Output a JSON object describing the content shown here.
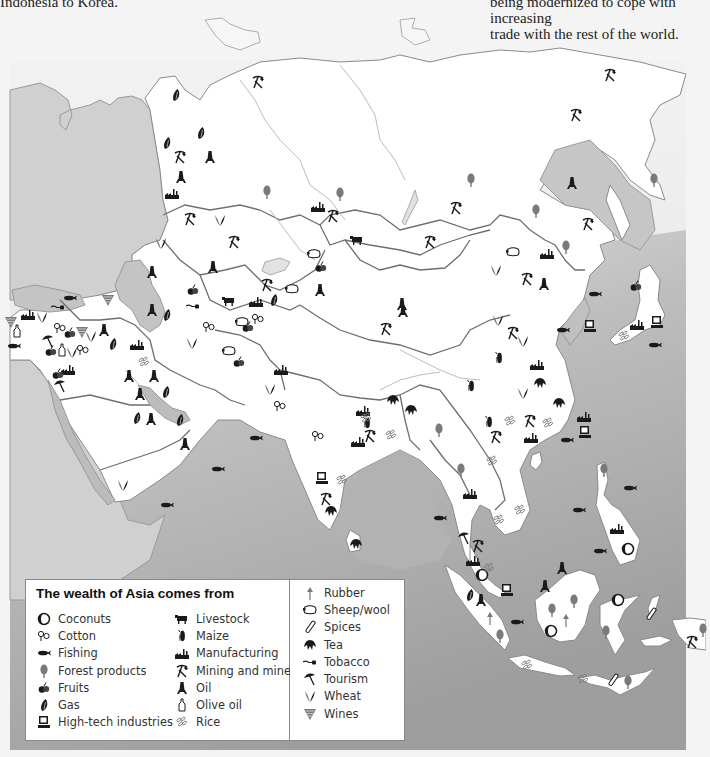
{
  "captions": {
    "left": "Indonesia to Korea.",
    "right_line1": "being modernized to cope with increasing",
    "right_line2": "trade with the rest of the world."
  },
  "colors": {
    "page_bg": "#f4f4f4",
    "sea": "#a9a9a9",
    "sea_light": "#c8c8c8",
    "land": "#ffffff",
    "other_land": "#cfcfcf",
    "border": "#6e6e6e",
    "river": "#b8b8b8",
    "icon_dark": "#1a1a1a",
    "icon_grey": "#7a7a7a"
  },
  "legend": {
    "title": "The wealth of Asia comes from",
    "columns": [
      [
        {
          "icon": "coconut-icon",
          "label": "Coconuts"
        },
        {
          "icon": "cotton-icon",
          "label": "Cotton"
        },
        {
          "icon": "fish-icon",
          "label": "Fishing"
        },
        {
          "icon": "tree-icon",
          "label": "Forest products"
        },
        {
          "icon": "fruit-icon",
          "label": "Fruits"
        },
        {
          "icon": "gas-flame-icon",
          "label": "Gas"
        },
        {
          "icon": "computer-icon",
          "label": "High-tech industries"
        }
      ],
      [
        {
          "icon": "cow-icon",
          "label": "Livestock"
        },
        {
          "icon": "maize-icon",
          "label": "Maize"
        },
        {
          "icon": "factory-icon",
          "label": "Manufacturing"
        },
        {
          "icon": "pickaxe-hammer-icon",
          "label": "Mining and minerals"
        },
        {
          "icon": "oil-derrick-icon",
          "label": "Oil"
        },
        {
          "icon": "olive-oil-bottle-icon",
          "label": "Olive oil"
        },
        {
          "icon": "rice-icon",
          "label": "Rice"
        }
      ],
      [
        {
          "icon": "rubber-tree-icon",
          "label": "Rubber"
        },
        {
          "icon": "sheep-icon",
          "label": "Sheep/wool"
        },
        {
          "icon": "spice-icon",
          "label": "Spices"
        },
        {
          "icon": "tea-leaf-icon",
          "label": "Tea"
        },
        {
          "icon": "tobacco-pipe-icon",
          "label": "Tobacco"
        },
        {
          "icon": "umbrella-icon",
          "label": "Tourism"
        },
        {
          "icon": "wheat-icon",
          "label": "Wheat"
        },
        {
          "icon": "grapes-icon",
          "label": "Wines"
        }
      ]
    ]
  },
  "map_icons": [
    {
      "type": "mine",
      "x": 258,
      "y": 82
    },
    {
      "type": "mine",
      "x": 610,
      "y": 75
    },
    {
      "type": "mine",
      "x": 576,
      "y": 115
    },
    {
      "type": "gas",
      "x": 176,
      "y": 95
    },
    {
      "type": "gas",
      "x": 201,
      "y": 133
    },
    {
      "type": "gas",
      "x": 167,
      "y": 143
    },
    {
      "type": "mine",
      "x": 180,
      "y": 157
    },
    {
      "type": "oil",
      "x": 210,
      "y": 157
    },
    {
      "type": "oil",
      "x": 181,
      "y": 177
    },
    {
      "type": "factory",
      "x": 172,
      "y": 193
    },
    {
      "type": "tree",
      "x": 267,
      "y": 192
    },
    {
      "type": "tree",
      "x": 340,
      "y": 194
    },
    {
      "type": "factory",
      "x": 318,
      "y": 206
    },
    {
      "type": "mine",
      "x": 333,
      "y": 216
    },
    {
      "type": "tree",
      "x": 471,
      "y": 180
    },
    {
      "type": "oil",
      "x": 572,
      "y": 183
    },
    {
      "type": "tree",
      "x": 654,
      "y": 180
    },
    {
      "type": "mine",
      "x": 456,
      "y": 208
    },
    {
      "type": "tree",
      "x": 536,
      "y": 211
    },
    {
      "type": "mine",
      "x": 588,
      "y": 224
    },
    {
      "type": "mine",
      "x": 190,
      "y": 219
    },
    {
      "type": "wheat",
      "x": 220,
      "y": 220
    },
    {
      "type": "mine",
      "x": 234,
      "y": 242
    },
    {
      "type": "wheat",
      "x": 161,
      "y": 243
    },
    {
      "type": "mine",
      "x": 430,
      "y": 242
    },
    {
      "type": "sheep",
      "x": 513,
      "y": 252
    },
    {
      "type": "factory",
      "x": 547,
      "y": 253
    },
    {
      "type": "tree",
      "x": 566,
      "y": 247
    },
    {
      "type": "cow",
      "x": 357,
      "y": 240
    },
    {
      "type": "sheep",
      "x": 314,
      "y": 254
    },
    {
      "type": "fruit",
      "x": 321,
      "y": 267
    },
    {
      "type": "wheat",
      "x": 496,
      "y": 270
    },
    {
      "type": "mine",
      "x": 527,
      "y": 279
    },
    {
      "type": "oil",
      "x": 544,
      "y": 284
    },
    {
      "type": "oil",
      "x": 152,
      "y": 272
    },
    {
      "type": "oil",
      "x": 213,
      "y": 267
    },
    {
      "type": "oil",
      "x": 320,
      "y": 290
    },
    {
      "type": "oil",
      "x": 402,
      "y": 304
    },
    {
      "type": "fruit",
      "x": 193,
      "y": 290
    },
    {
      "type": "tobacco",
      "x": 193,
      "y": 306
    },
    {
      "type": "cow",
      "x": 229,
      "y": 301
    },
    {
      "type": "factory",
      "x": 256,
      "y": 301
    },
    {
      "type": "gas",
      "x": 274,
      "y": 300
    },
    {
      "type": "mine",
      "x": 267,
      "y": 285
    },
    {
      "type": "sheep",
      "x": 292,
      "y": 289
    },
    {
      "type": "fish",
      "x": 595,
      "y": 294
    },
    {
      "type": "fruit",
      "x": 636,
      "y": 286
    },
    {
      "type": "fish",
      "x": 70,
      "y": 298
    },
    {
      "type": "grapes",
      "x": 108,
      "y": 300
    },
    {
      "type": "tobacco",
      "x": 58,
      "y": 307
    },
    {
      "type": "grapes",
      "x": 11,
      "y": 322
    },
    {
      "type": "factory",
      "x": 28,
      "y": 314
    },
    {
      "type": "wheat",
      "x": 42,
      "y": 317
    },
    {
      "type": "oil",
      "x": 152,
      "y": 310
    },
    {
      "type": "gas",
      "x": 167,
      "y": 315
    },
    {
      "type": "olive",
      "x": 17,
      "y": 331
    },
    {
      "type": "cotton",
      "x": 60,
      "y": 328
    },
    {
      "type": "fruit",
      "x": 70,
      "y": 333
    },
    {
      "type": "grapes",
      "x": 82,
      "y": 332
    },
    {
      "type": "oil",
      "x": 104,
      "y": 330
    },
    {
      "type": "cotton",
      "x": 209,
      "y": 327
    },
    {
      "type": "wheat",
      "x": 192,
      "y": 343
    },
    {
      "type": "sheep",
      "x": 242,
      "y": 322
    },
    {
      "type": "fruit",
      "x": 248,
      "y": 327
    },
    {
      "type": "cotton",
      "x": 258,
      "y": 319
    },
    {
      "type": "fish",
      "x": 14,
      "y": 346
    },
    {
      "type": "umbrella",
      "x": 48,
      "y": 341
    },
    {
      "type": "fruit",
      "x": 51,
      "y": 351
    },
    {
      "type": "olive",
      "x": 62,
      "y": 350
    },
    {
      "type": "wheat",
      "x": 72,
      "y": 352
    },
    {
      "type": "cotton",
      "x": 83,
      "y": 350
    },
    {
      "type": "wheat",
      "x": 91,
      "y": 336
    },
    {
      "type": "gas",
      "x": 113,
      "y": 344
    },
    {
      "type": "factory",
      "x": 137,
      "y": 344
    },
    {
      "type": "sheep",
      "x": 229,
      "y": 351
    },
    {
      "type": "fruit",
      "x": 239,
      "y": 362
    },
    {
      "type": "mine",
      "x": 386,
      "y": 329
    },
    {
      "type": "oil",
      "x": 403,
      "y": 311
    },
    {
      "type": "factory",
      "x": 68,
      "y": 369
    },
    {
      "type": "fruit",
      "x": 58,
      "y": 374
    },
    {
      "type": "rice",
      "x": 144,
      "y": 362
    },
    {
      "type": "oil",
      "x": 129,
      "y": 376
    },
    {
      "type": "oil",
      "x": 154,
      "y": 376
    },
    {
      "type": "factory",
      "x": 281,
      "y": 369
    },
    {
      "type": "wheat",
      "x": 270,
      "y": 389
    },
    {
      "type": "umbrella",
      "x": 60,
      "y": 386
    },
    {
      "type": "oil",
      "x": 140,
      "y": 394
    },
    {
      "type": "gas",
      "x": 166,
      "y": 392
    },
    {
      "type": "wheat",
      "x": 523,
      "y": 341
    },
    {
      "type": "wheat",
      "x": 498,
      "y": 320
    },
    {
      "type": "mine",
      "x": 513,
      "y": 333
    },
    {
      "type": "maize",
      "x": 499,
      "y": 358
    },
    {
      "type": "factory",
      "x": 537,
      "y": 364
    },
    {
      "type": "fish",
      "x": 563,
      "y": 330
    },
    {
      "type": "computer",
      "x": 590,
      "y": 326
    },
    {
      "type": "rice",
      "x": 624,
      "y": 336
    },
    {
      "type": "factory",
      "x": 637,
      "y": 324
    },
    {
      "type": "computer",
      "x": 657,
      "y": 322
    },
    {
      "type": "fish",
      "x": 655,
      "y": 345
    },
    {
      "type": "gas",
      "x": 137,
      "y": 418
    },
    {
      "type": "oil",
      "x": 151,
      "y": 419
    },
    {
      "type": "gas",
      "x": 180,
      "y": 420
    },
    {
      "type": "cotton",
      "x": 280,
      "y": 406
    },
    {
      "type": "maize",
      "x": 471,
      "y": 386
    },
    {
      "type": "tea",
      "x": 540,
      "y": 383
    },
    {
      "type": "wheat",
      "x": 523,
      "y": 393
    },
    {
      "type": "tea",
      "x": 559,
      "y": 403
    },
    {
      "type": "factory",
      "x": 363,
      "y": 410
    },
    {
      "type": "maize",
      "x": 367,
      "y": 423
    },
    {
      "type": "tea",
      "x": 393,
      "y": 400
    },
    {
      "type": "tea",
      "x": 411,
      "y": 410
    },
    {
      "type": "oil",
      "x": 185,
      "y": 444
    },
    {
      "type": "fish",
      "x": 256,
      "y": 438
    },
    {
      "type": "cotton",
      "x": 318,
      "y": 436
    },
    {
      "type": "factory",
      "x": 358,
      "y": 441
    },
    {
      "type": "mine",
      "x": 370,
      "y": 436
    },
    {
      "type": "rice",
      "x": 366,
      "y": 418
    },
    {
      "type": "rice",
      "x": 391,
      "y": 435
    },
    {
      "type": "tree",
      "x": 439,
      "y": 430
    },
    {
      "type": "maize",
      "x": 489,
      "y": 422
    },
    {
      "type": "rice",
      "x": 510,
      "y": 421
    },
    {
      "type": "mine",
      "x": 530,
      "y": 421
    },
    {
      "type": "rice",
      "x": 548,
      "y": 423
    },
    {
      "type": "factory",
      "x": 531,
      "y": 437
    },
    {
      "type": "factory",
      "x": 584,
      "y": 416
    },
    {
      "type": "computer",
      "x": 585,
      "y": 432
    },
    {
      "type": "mine",
      "x": 496,
      "y": 437
    },
    {
      "type": "fish",
      "x": 567,
      "y": 440
    },
    {
      "type": "fish",
      "x": 218,
      "y": 469
    },
    {
      "type": "rice",
      "x": 492,
      "y": 461
    },
    {
      "type": "tree",
      "x": 461,
      "y": 470
    },
    {
      "type": "tree",
      "x": 604,
      "y": 470
    },
    {
      "type": "fish",
      "x": 630,
      "y": 488
    },
    {
      "type": "computer",
      "x": 322,
      "y": 478
    },
    {
      "type": "rice",
      "x": 342,
      "y": 480
    },
    {
      "type": "mine",
      "x": 326,
      "y": 499
    },
    {
      "type": "tea",
      "x": 331,
      "y": 511
    },
    {
      "type": "wheat",
      "x": 123,
      "y": 485
    },
    {
      "type": "fish",
      "x": 167,
      "y": 505
    },
    {
      "type": "factory",
      "x": 470,
      "y": 493
    },
    {
      "type": "fish",
      "x": 440,
      "y": 518
    },
    {
      "type": "rice",
      "x": 520,
      "y": 510
    },
    {
      "type": "rice",
      "x": 499,
      "y": 520
    },
    {
      "type": "fish",
      "x": 579,
      "y": 510
    },
    {
      "type": "factory",
      "x": 617,
      "y": 528
    },
    {
      "type": "coconut",
      "x": 628,
      "y": 549
    },
    {
      "type": "fish",
      "x": 600,
      "y": 551
    },
    {
      "type": "tea",
      "x": 356,
      "y": 544
    },
    {
      "type": "umbrella",
      "x": 464,
      "y": 538
    },
    {
      "type": "mine",
      "x": 478,
      "y": 546
    },
    {
      "type": "factory",
      "x": 473,
      "y": 560
    },
    {
      "type": "coconut",
      "x": 482,
      "y": 575
    },
    {
      "type": "rice",
      "x": 489,
      "y": 568
    },
    {
      "type": "oil",
      "x": 562,
      "y": 568
    },
    {
      "type": "computer",
      "x": 507,
      "y": 590
    },
    {
      "type": "oil",
      "x": 545,
      "y": 586
    },
    {
      "type": "gas",
      "x": 470,
      "y": 595
    },
    {
      "type": "oil",
      "x": 481,
      "y": 600
    },
    {
      "type": "coconut",
      "x": 618,
      "y": 600
    },
    {
      "type": "tree",
      "x": 574,
      "y": 601
    },
    {
      "type": "tree",
      "x": 552,
      "y": 610
    },
    {
      "type": "rubber",
      "x": 490,
      "y": 618
    },
    {
      "type": "fish",
      "x": 517,
      "y": 622
    },
    {
      "type": "rubber",
      "x": 566,
      "y": 620
    },
    {
      "type": "spice",
      "x": 651,
      "y": 614
    },
    {
      "type": "tree",
      "x": 606,
      "y": 632
    },
    {
      "type": "coconut",
      "x": 551,
      "y": 631
    },
    {
      "type": "tree",
      "x": 500,
      "y": 636
    },
    {
      "type": "tree",
      "x": 703,
      "y": 630
    },
    {
      "type": "mine",
      "x": 692,
      "y": 642
    },
    {
      "type": "rice",
      "x": 527,
      "y": 665
    },
    {
      "type": "rice",
      "x": 583,
      "y": 679
    },
    {
      "type": "spice",
      "x": 613,
      "y": 680
    },
    {
      "type": "tree",
      "x": 628,
      "y": 682
    }
  ]
}
